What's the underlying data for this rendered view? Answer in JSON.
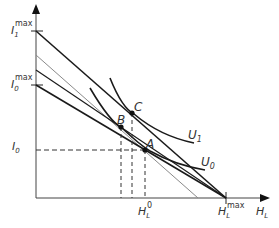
{
  "diagram": {
    "axes": {
      "x_label": "H",
      "x_label_sub": "L",
      "y_ticks": [
        {
          "main": "I",
          "sub": "1",
          "sup": "max"
        },
        {
          "main": "I",
          "sub": "0",
          "sup": "max"
        },
        {
          "main": "I",
          "sub": "0",
          "sup": ""
        }
      ],
      "x_ticks": [
        {
          "main": "H",
          "sub": "L",
          "sup": "0"
        },
        {
          "main": "H",
          "sub": "L",
          "sup": "max"
        }
      ]
    },
    "points": [
      {
        "label": "A"
      },
      {
        "label": "B"
      },
      {
        "label": "C"
      }
    ],
    "curves": [
      {
        "label": "U",
        "sub": "1"
      },
      {
        "label": "U",
        "sub": "0"
      }
    ],
    "colors": {
      "line": "#1a1a1a",
      "gray_line": "#8a8a8a",
      "axis": "#333333"
    }
  }
}
